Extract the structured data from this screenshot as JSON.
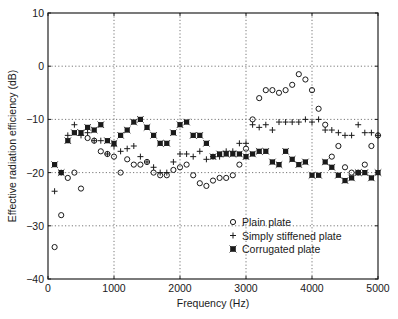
{
  "chart_data": {
    "type": "scatter",
    "title": "",
    "xlabel": "Frequency (Hz)",
    "ylabel": "Effective radiation efficiency (dB)",
    "xlim": [
      0,
      5000
    ],
    "ylim": [
      -40,
      10
    ],
    "xticks": [
      0,
      1000,
      2000,
      3000,
      4000,
      5000
    ],
    "yticks": [
      10,
      0,
      -10,
      -20,
      -30,
      -40
    ],
    "xtick_labels": [
      "0",
      "1000",
      "2000",
      "3000",
      "4000",
      "5000"
    ],
    "ytick_labels": [
      "10",
      "0",
      "−10",
      "−20",
      "−30",
      "−40"
    ],
    "grid": true,
    "legend_position": "lower-center-right",
    "x": [
      100,
      200,
      300,
      400,
      500,
      600,
      700,
      800,
      900,
      1000,
      1100,
      1200,
      1300,
      1400,
      1500,
      1600,
      1700,
      1800,
      1900,
      2000,
      2100,
      2200,
      2300,
      2400,
      2500,
      2600,
      2700,
      2800,
      2900,
      3000,
      3100,
      3200,
      3300,
      3400,
      3500,
      3600,
      3700,
      3800,
      3900,
      4000,
      4100,
      4200,
      4300,
      4400,
      4500,
      4600,
      4700,
      4800,
      4900,
      5000
    ],
    "series": [
      {
        "name": "Plain plate",
        "marker": "circle",
        "values": [
          -34,
          -28,
          -21,
          -20,
          -23,
          -13.5,
          -14,
          -16,
          -16.5,
          -17,
          -20,
          -17.5,
          -18.5,
          -18.5,
          -18,
          -20,
          -20.5,
          -20.5,
          -19.5,
          -19,
          -18.5,
          -20.5,
          -22,
          -22.5,
          -21.5,
          -21,
          -21,
          -20.5,
          -18.5,
          -15.5,
          -10,
          -6,
          -4.5,
          -4.5,
          -5,
          -4.5,
          -3.5,
          -1.5,
          -2.5,
          -4.5,
          -8,
          -11,
          -17,
          -15,
          -19,
          -20,
          -20,
          -18.5,
          -15,
          -13
        ]
      },
      {
        "name": "Simply stiffened plate",
        "marker": "plus",
        "values": [
          -23.5,
          -20,
          -13,
          -11,
          -13,
          -12.5,
          -14,
          -14,
          -16.5,
          -15,
          -16,
          -15.5,
          -15,
          -17,
          -18,
          -19,
          -20,
          -20,
          -18,
          -16.5,
          -16.5,
          -17,
          -16,
          -17.5,
          -17,
          -17,
          -16,
          -16,
          -14.5,
          -14.5,
          -11,
          -11.5,
          -11,
          -12,
          -10.5,
          -10.5,
          -10.5,
          -10.5,
          -10,
          -10.5,
          -10,
          -12,
          -12,
          -12.5,
          -13,
          -13,
          -11,
          -12.5,
          -12.5,
          -13
        ]
      },
      {
        "name": "Corrugated plate",
        "marker": "asterisk-square",
        "values": [
          -18.5,
          -20,
          -14,
          -12.5,
          -12.5,
          -11.5,
          -12,
          -11,
          -14,
          -14.5,
          -13,
          -12,
          -10.5,
          -10,
          -11.5,
          -13,
          -14.5,
          -14.5,
          -12.5,
          -11,
          -10.5,
          -13,
          -13,
          -14.5,
          -17,
          -16.5,
          -16.5,
          -16.5,
          -16.5,
          -17,
          -16.5,
          -16,
          -16,
          -18,
          -18.5,
          -16,
          -17.5,
          -18.5,
          -18,
          -20.5,
          -20.5,
          -18,
          -19,
          -20.5,
          -21.5,
          -21,
          -20,
          -20,
          -21,
          -20
        ]
      }
    ]
  },
  "legend": {
    "items": [
      {
        "label": "Plain plate",
        "marker": "circle"
      },
      {
        "label": "Simply stiffened plate",
        "marker": "plus"
      },
      {
        "label": "Corrugated plate",
        "marker": "asterisk-square"
      }
    ]
  },
  "axes": {
    "xlabel": "Frequency (Hz)",
    "ylabel": "Effective radiation efficiency (dB)"
  },
  "colors": {
    "ink": "#1a1a1a",
    "grid": "#555555",
    "background": "#ffffff"
  }
}
